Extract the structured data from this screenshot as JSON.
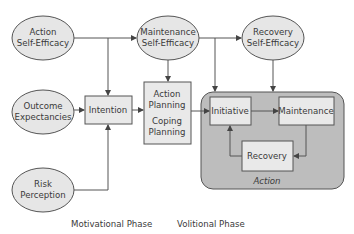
{
  "diagram": {
    "nodes": {
      "action_self_efficacy": {
        "line1": "Action",
        "line2": "Self-Efficacy",
        "shape": "ellipse"
      },
      "maintenance_self_efficacy": {
        "line1": "Maintenance",
        "line2": "Self-Efficacy",
        "shape": "ellipse"
      },
      "recovery_self_efficacy": {
        "line1": "Recovery",
        "line2": "Self-Efficacy",
        "shape": "ellipse"
      },
      "outcome_expectancies": {
        "line1": "Outcome",
        "line2": "Expectancies",
        "shape": "ellipse"
      },
      "risk_perception": {
        "line1": "Risk",
        "line2": "Perception",
        "shape": "ellipse"
      },
      "intention": {
        "label": "Intention",
        "shape": "box"
      },
      "planning": {
        "line1": "Action",
        "line2": "Planning",
        "line3": "Coping",
        "line4": "Planning",
        "shape": "box"
      },
      "initiative": {
        "label": "Initiative",
        "shape": "box"
      },
      "maintenance": {
        "label": "Maintenance",
        "shape": "box"
      },
      "recovery": {
        "label": "Recovery",
        "shape": "box"
      },
      "action_group": {
        "label": "Action",
        "shape": "rounded-group"
      }
    },
    "edges": [
      {
        "from": "Action Self-Efficacy",
        "to": "Maintenance Self-Efficacy"
      },
      {
        "from": "Action Self-Efficacy",
        "to": "Intention"
      },
      {
        "from": "Outcome Expectancies",
        "to": "Intention"
      },
      {
        "from": "Risk Perception",
        "to": "Intention"
      },
      {
        "from": "Intention",
        "to": "Action/Coping Planning"
      },
      {
        "from": "Maintenance Self-Efficacy",
        "to": "Action/Coping Planning"
      },
      {
        "from": "Maintenance Self-Efficacy",
        "to": "Recovery Self-Efficacy"
      },
      {
        "from": "Maintenance Self-Efficacy",
        "to": "Initiative"
      },
      {
        "from": "Recovery Self-Efficacy",
        "to": "Maintenance"
      },
      {
        "from": "Action/Coping Planning",
        "to": "Initiative"
      },
      {
        "from": "Initiative",
        "to": "Maintenance"
      },
      {
        "from": "Maintenance",
        "to": "Recovery"
      },
      {
        "from": "Recovery",
        "to": "Initiative"
      }
    ],
    "phases": {
      "motivational": "Motivational Phase",
      "volitional": "Volitional Phase"
    },
    "colors": {
      "node_fill": "#e6e6e6",
      "group_fill": "#bdbdbd",
      "stroke": "#555555"
    }
  }
}
